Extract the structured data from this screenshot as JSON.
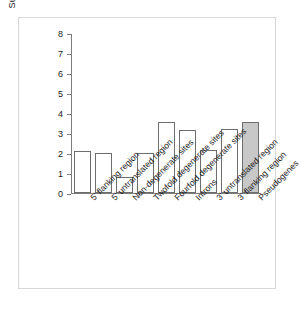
{
  "chart_data": {
    "type": "bar",
    "title": "",
    "xlabel": "",
    "ylabel": "Substitutions per nucleotide per 10⁹ years",
    "ylabel_line1": "Substitutions per nucleotide",
    "ylabel_line2_pre": "per 10",
    "ylabel_line2_sup": "9",
    "ylabel_line2_post": " years",
    "ylim": [
      0,
      8
    ],
    "ytick_labels": [
      "8",
      "7",
      "6",
      "5",
      "4",
      "3",
      "2",
      "1",
      "0"
    ],
    "ytick_values": [
      8,
      7,
      6,
      5,
      4,
      3,
      2,
      1,
      0
    ],
    "grid": false,
    "legend": "none",
    "categories": [
      "5' flanking region",
      "5' untranslated region",
      "Non-degenerate sites",
      "Twofold degenerate sites",
      "Fourfold degenerate sites",
      "Introns",
      "3' untranslated region",
      "3' flanking region",
      "Pseudogenes"
    ],
    "values": [
      2.1,
      2.0,
      0.8,
      2.0,
      3.55,
      3.15,
      2.15,
      3.2,
      3.55
    ],
    "bar_styles": [
      "open",
      "open",
      "open",
      "open",
      "open",
      "open",
      "open",
      "open",
      "filled"
    ],
    "colors": {
      "bar_open_fill": "#ffffff",
      "bar_filled_fill": "#c8c8c8",
      "bar_stroke": "#6e6e6e",
      "axis": "#7d7d7d",
      "text": "#1a1a1a",
      "frame": "#d8d8d8"
    }
  }
}
